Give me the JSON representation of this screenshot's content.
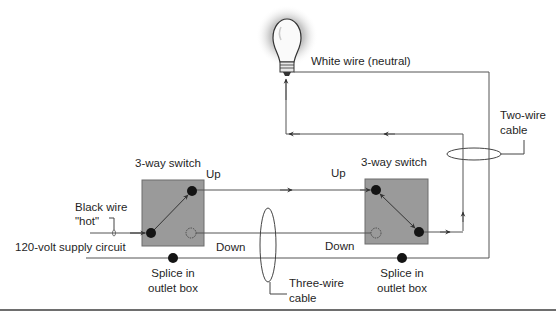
{
  "diagram": {
    "labels": {
      "white_wire": "White wire (neutral)",
      "two_wire_cable_1": "Two-wire",
      "two_wire_cable_2": "cable",
      "switch_left": "3-way switch",
      "switch_right": "3-way switch",
      "up_left": "Up",
      "up_right": "Up",
      "down_left": "Down",
      "down_right": "Down",
      "black_wire_1": "Black wire",
      "black_wire_2": "\"hot\"",
      "supply": "120-volt supply circuit",
      "splice_left_1": "Splice in",
      "splice_left_2": "outlet box",
      "splice_right_1": "Splice in",
      "splice_right_2": "outlet box",
      "three_wire_1": "Three-wire",
      "three_wire_2": "cable"
    },
    "colors": {
      "wire": "#555555",
      "switch_box": "#9a9a9a",
      "terminal": "#141414",
      "glow": "#b5b5b5",
      "rule": "#6e6e6e"
    },
    "components": [
      {
        "type": "light-bulb",
        "label": ""
      },
      {
        "type": "3-way-switch",
        "label": "3-way switch",
        "position": "left"
      },
      {
        "type": "3-way-switch",
        "label": "3-way switch",
        "position": "right"
      },
      {
        "type": "splice",
        "label": "Splice in outlet box",
        "position": "left"
      },
      {
        "type": "splice",
        "label": "Splice in outlet box",
        "position": "right"
      },
      {
        "type": "cable",
        "label": "Three-wire cable"
      },
      {
        "type": "cable",
        "label": "Two-wire cable"
      }
    ]
  }
}
